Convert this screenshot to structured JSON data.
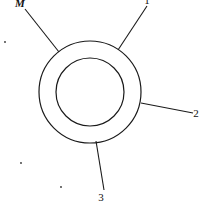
{
  "diagram": {
    "outer_circle": {
      "cx": 90,
      "cy": 92,
      "r": 51
    },
    "inner_circle": {
      "cx": 90,
      "cy": 92,
      "r": 34
    },
    "stroke_color": "#1a1a1a",
    "spokes": [
      {
        "label": "M",
        "x1": 59,
        "y1": 52,
        "x2": 25,
        "y2": 9,
        "lx": 20,
        "ly": 7
      },
      {
        "label": "1",
        "x1": 118,
        "y1": 50,
        "x2": 147,
        "y2": 6,
        "lx": 147,
        "ly": 4
      },
      {
        "label": "2",
        "x1": 141,
        "y1": 103,
        "x2": 193,
        "y2": 113,
        "lx": 196,
        "ly": 117
      },
      {
        "label": "3",
        "x1": 96,
        "y1": 141,
        "x2": 104,
        "y2": 190,
        "lx": 101,
        "ly": 201
      }
    ],
    "dots": [
      {
        "x": 5,
        "y": 42
      },
      {
        "x": 21,
        "y": 163
      },
      {
        "x": 61,
        "y": 187
      }
    ]
  }
}
